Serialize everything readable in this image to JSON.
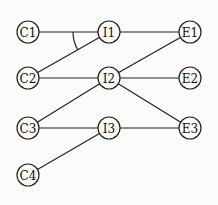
{
  "diagram": {
    "type": "network",
    "nodes": [
      {
        "id": "C1",
        "label": "C1",
        "x": 28,
        "y": 32
      },
      {
        "id": "C2",
        "label": "C2",
        "x": 28,
        "y": 78
      },
      {
        "id": "C3",
        "label": "C3",
        "x": 28,
        "y": 128
      },
      {
        "id": "C4",
        "label": "C4",
        "x": 28,
        "y": 175
      },
      {
        "id": "I1",
        "label": "I1",
        "x": 109,
        "y": 32
      },
      {
        "id": "I2",
        "label": "I2",
        "x": 109,
        "y": 78
      },
      {
        "id": "I3",
        "label": "I3",
        "x": 109,
        "y": 128
      },
      {
        "id": "E1",
        "label": "E1",
        "x": 190,
        "y": 32
      },
      {
        "id": "E2",
        "label": "E2",
        "x": 190,
        "y": 78
      },
      {
        "id": "E3",
        "label": "E3",
        "x": 190,
        "y": 128
      }
    ],
    "edges": [
      [
        "C1",
        "I1"
      ],
      [
        "C2",
        "I1"
      ],
      [
        "I1",
        "E1"
      ],
      [
        "C2",
        "I2"
      ],
      [
        "C3",
        "I2"
      ],
      [
        "I2",
        "E1"
      ],
      [
        "I2",
        "E2"
      ],
      [
        "I2",
        "E3"
      ],
      [
        "C3",
        "I3"
      ],
      [
        "C4",
        "I3"
      ],
      [
        "I3",
        "E3"
      ]
    ],
    "and_arcs": [
      {
        "node": "I1",
        "between": [
          "C1",
          "C2"
        ]
      }
    ]
  }
}
